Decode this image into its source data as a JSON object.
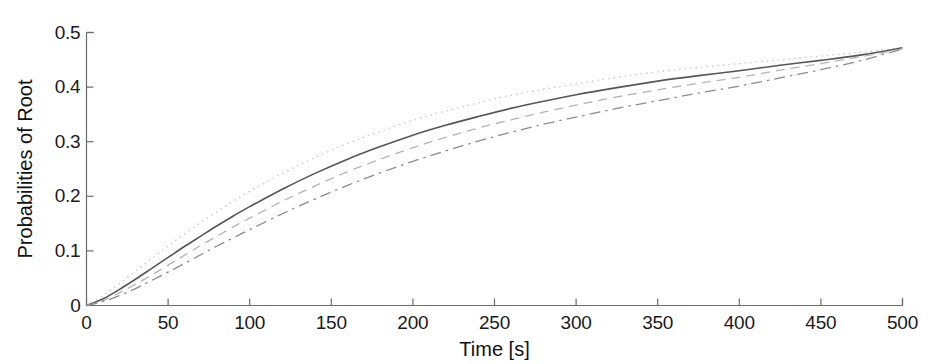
{
  "chart_data": {
    "type": "line",
    "title": "",
    "xlabel": "Time [s]",
    "ylabel": "Probabilities of Root",
    "xlim": [
      0,
      500
    ],
    "ylim": [
      0,
      0.5
    ],
    "xticks": [
      0,
      50,
      100,
      150,
      200,
      250,
      300,
      350,
      400,
      450,
      500
    ],
    "xtick_labels": [
      "0",
      "50",
      "100",
      "150",
      "200",
      "250",
      "300",
      "350",
      "400",
      "450",
      "500"
    ],
    "yticks": [
      0,
      0.1,
      0.2,
      0.3,
      0.4,
      0.5
    ],
    "ytick_labels": [
      "0",
      "0.1",
      "0.2",
      "0.3",
      "0.4",
      "0.5"
    ],
    "grid": false,
    "legend": "none",
    "x": [
      0,
      10,
      20,
      30,
      40,
      50,
      60,
      70,
      80,
      90,
      100,
      120,
      140,
      160,
      180,
      200,
      220,
      240,
      260,
      280,
      300,
      325,
      350,
      375,
      400,
      425,
      450,
      475,
      500
    ],
    "series": [
      {
        "name": "curve-1",
        "style": "dotted",
        "color": "#c8c8c8",
        "values": [
          0.0,
          0.018,
          0.04,
          0.063,
          0.086,
          0.109,
          0.131,
          0.152,
          0.172,
          0.191,
          0.209,
          0.242,
          0.271,
          0.297,
          0.319,
          0.339,
          0.356,
          0.371,
          0.385,
          0.396,
          0.406,
          0.418,
          0.428,
          0.436,
          0.443,
          0.45,
          0.457,
          0.464,
          0.472
        ]
      },
      {
        "name": "curve-2",
        "style": "solid",
        "color": "#565656",
        "values": [
          0.0,
          0.012,
          0.029,
          0.048,
          0.068,
          0.088,
          0.108,
          0.127,
          0.146,
          0.164,
          0.181,
          0.213,
          0.242,
          0.268,
          0.291,
          0.312,
          0.33,
          0.346,
          0.361,
          0.374,
          0.386,
          0.399,
          0.411,
          0.421,
          0.43,
          0.44,
          0.449,
          0.459,
          0.472
        ]
      },
      {
        "name": "curve-3",
        "style": "dashed",
        "color": "#b4b4b4",
        "values": [
          0.0,
          0.009,
          0.023,
          0.039,
          0.056,
          0.074,
          0.092,
          0.11,
          0.127,
          0.144,
          0.16,
          0.191,
          0.219,
          0.245,
          0.268,
          0.289,
          0.308,
          0.325,
          0.34,
          0.354,
          0.367,
          0.382,
          0.395,
          0.407,
          0.418,
          0.431,
          0.443,
          0.456,
          0.47
        ]
      },
      {
        "name": "curve-4",
        "style": "dashdot",
        "color": "#8c8c8c",
        "values": [
          0.0,
          0.007,
          0.018,
          0.031,
          0.046,
          0.061,
          0.077,
          0.093,
          0.109,
          0.124,
          0.139,
          0.168,
          0.195,
          0.22,
          0.243,
          0.264,
          0.283,
          0.301,
          0.317,
          0.332,
          0.345,
          0.361,
          0.375,
          0.389,
          0.402,
          0.417,
          0.432,
          0.449,
          0.47
        ]
      }
    ]
  },
  "axes": {
    "axis_color": "#6b6b6b",
    "tick_color": "#6b6b6b"
  }
}
